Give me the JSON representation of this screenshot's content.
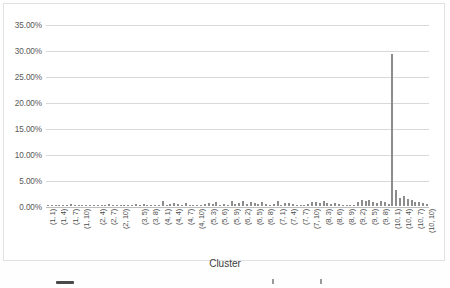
{
  "chart_data": {
    "type": "bar",
    "title": "",
    "xlabel": "Cluster",
    "ylabel": "",
    "ylim": [
      0,
      35
    ],
    "ytick_labels": [
      "35.00%",
      "30.00%",
      "25.00%",
      "20.00%",
      "15.00%",
      "10.00%",
      "5.00%",
      "0.00%"
    ],
    "ytick_values": [
      35,
      30,
      25,
      20,
      15,
      10,
      5,
      0
    ],
    "grid": true,
    "legend": "none",
    "bar_color": "#8c8c8c",
    "categories": [
      "(1, 1)",
      "(1, 2)",
      "(1, 3)",
      "(1, 4)",
      "(1, 5)",
      "(1, 6)",
      "(1, 7)",
      "(1, 8)",
      "(1, 9)",
      "(1, 10)",
      "(2, 1)",
      "(2, 2)",
      "(2, 3)",
      "(2, 4)",
      "(2, 5)",
      "(2, 6)",
      "(2, 7)",
      "(2, 8)",
      "(2, 9)",
      "(2, 10)",
      "(3, 1)",
      "(3, 2)",
      "(3, 3)",
      "(3, 4)",
      "(3, 5)",
      "(3, 6)",
      "(3, 7)",
      "(3, 8)",
      "(3, 9)",
      "(3, 10)",
      "(4, 1)",
      "(4, 2)",
      "(4, 3)",
      "(4, 4)",
      "(4, 5)",
      "(4, 6)",
      "(4, 7)",
      "(4, 8)",
      "(4, 9)",
      "(4, 10)",
      "(5, 1)",
      "(5, 2)",
      "(5, 3)",
      "(5, 4)",
      "(5, 5)",
      "(5, 6)",
      "(5, 7)",
      "(5, 8)",
      "(5, 9)",
      "(5, 10)",
      "(6, 1)",
      "(6, 2)",
      "(6, 3)",
      "(6, 4)",
      "(6, 5)",
      "(6, 6)",
      "(6, 7)",
      "(6, 8)",
      "(6, 9)",
      "(6, 10)",
      "(7, 1)",
      "(7, 2)",
      "(7, 3)",
      "(7, 4)",
      "(7, 5)",
      "(7, 6)",
      "(7, 7)",
      "(7, 8)",
      "(7, 9)",
      "(7, 10)",
      "(8, 1)",
      "(8, 2)",
      "(8, 3)",
      "(8, 4)",
      "(8, 5)",
      "(8, 6)",
      "(8, 7)",
      "(8, 8)",
      "(8, 9)",
      "(8, 10)",
      "(9, 1)",
      "(9, 2)",
      "(9, 3)",
      "(9, 4)",
      "(9, 5)",
      "(9, 6)",
      "(9, 7)",
      "(9, 8)",
      "(9, 9)",
      "(9, 10)",
      "(10, 1)",
      "(10, 2)",
      "(10, 3)",
      "(10, 4)",
      "(10, 5)",
      "(10, 6)",
      "(10, 7)",
      "(10, 8)",
      "(10, 9)",
      "(10, 10)"
    ],
    "visible_tick_labels": [
      "(1, 1)",
      "(1, 4)",
      "(1, 7)",
      "(1, 10)",
      "(2, 4)",
      "(2, 7)",
      "(2, 10)",
      "(3, 5)",
      "(3, 8)",
      "(4, 1)",
      "(4, 4)",
      "(4, 7)",
      "(4, 10)",
      "(5, 3)",
      "(5, 6)",
      "(5, 9)",
      "(6, 2)",
      "(6, 5)",
      "(6, 8)",
      "(7, 1)",
      "(7, 4)",
      "(7, 7)",
      "(7, 10)",
      "(8, 3)",
      "(8, 6)",
      "(8, 9)",
      "(9, 2)",
      "(9, 5)",
      "(9, 8)",
      "(10, 1)",
      "(10, 4)",
      "(10, 7)",
      "(10, 10)"
    ],
    "values": [
      0.05,
      0.05,
      0.05,
      0.05,
      0.05,
      0.05,
      0.4,
      0.1,
      0.05,
      0.15,
      0.05,
      0.05,
      0.05,
      0.05,
      0.05,
      0.05,
      0.3,
      0.25,
      0.05,
      0.05,
      0.05,
      0.2,
      0.1,
      0.4,
      0.15,
      0.3,
      0.2,
      0.25,
      0.05,
      0.1,
      1.0,
      0.2,
      0.35,
      0.55,
      0.3,
      0.1,
      0.55,
      0.2,
      0.05,
      0.05,
      0.1,
      0.45,
      0.55,
      0.35,
      0.7,
      0.25,
      0.45,
      0.2,
      0.95,
      0.35,
      0.6,
      0.95,
      0.3,
      0.75,
      0.5,
      0.45,
      0.85,
      0.3,
      0.2,
      0.4,
      0.9,
      0.25,
      0.55,
      0.65,
      0.35,
      0.2,
      0.15,
      0.1,
      0.3,
      0.8,
      0.7,
      0.5,
      0.95,
      0.6,
      0.45,
      0.55,
      0.35,
      0.25,
      0.15,
      0.1,
      0.2,
      0.85,
      1.1,
      0.95,
      1.25,
      0.8,
      0.6,
      0.9,
      0.7,
      0.45,
      29.2,
      3.1,
      1.55,
      1.95,
      1.35,
      1.1,
      0.85,
      0.7,
      0.55,
      0.4
    ],
    "max_value": 29.2,
    "max_value_category": "(10, 1)"
  }
}
